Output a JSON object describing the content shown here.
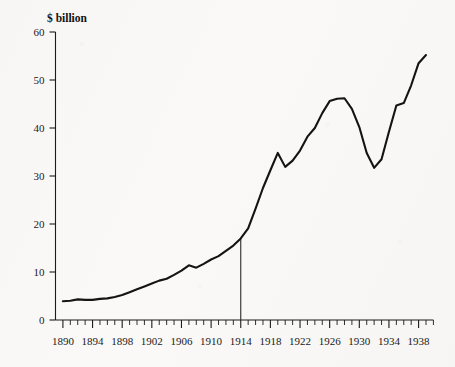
{
  "figure": {
    "background_color": "#faf9f7",
    "line_color": "#141414",
    "axis_color": "#1b1b1b"
  },
  "axis_title": "$ billion",
  "chart_data": {
    "type": "line",
    "title": "",
    "subtitle": "",
    "xlabel": "",
    "ylabel": "$ billion",
    "xlim": [
      1889,
      1940
    ],
    "ylim": [
      0,
      60
    ],
    "grid": false,
    "legend": "none",
    "y_ticks": [
      0,
      10,
      20,
      30,
      40,
      50,
      60
    ],
    "y_tick_labels": [
      "0",
      "10",
      "20",
      "30",
      "40",
      "50",
      "60"
    ],
    "x_ticks": [
      1890,
      1894,
      1898,
      1902,
      1906,
      1910,
      1914,
      1918,
      1922,
      1926,
      1930,
      1934,
      1938
    ],
    "x_tick_labels": [
      "1890",
      "1894",
      "1898",
      "1902",
      "1906",
      "1910",
      "1914",
      "1918",
      "1922",
      "1926",
      "1930",
      "1934",
      "1938"
    ],
    "x_minor_tick_step": 1,
    "annotations": [
      {
        "type": "vertical-line",
        "x": 1914,
        "y_from": 0,
        "y_to": 17,
        "label": ""
      }
    ],
    "x": [
      1890,
      1891,
      1892,
      1893,
      1894,
      1895,
      1896,
      1897,
      1898,
      1899,
      1900,
      1901,
      1902,
      1903,
      1904,
      1905,
      1906,
      1907,
      1908,
      1909,
      1910,
      1911,
      1912,
      1913,
      1914,
      1915,
      1916,
      1917,
      1918,
      1919,
      1920,
      1921,
      1922,
      1923,
      1924,
      1925,
      1926,
      1927,
      1928,
      1929,
      1930,
      1931,
      1932,
      1933,
      1934,
      1935,
      1936,
      1937,
      1938,
      1939
    ],
    "series": [
      {
        "name": "$ billion",
        "values": [
          3.9,
          4.0,
          4.3,
          4.2,
          4.2,
          4.4,
          4.5,
          4.8,
          5.2,
          5.8,
          6.4,
          7.0,
          7.6,
          8.2,
          8.6,
          9.4,
          10.3,
          11.4,
          10.9,
          11.7,
          12.6,
          13.3,
          14.4,
          15.5,
          17.0,
          19.1,
          23.2,
          27.5,
          31.2,
          34.8,
          31.9,
          33.2,
          35.3,
          38.2,
          40.0,
          43.1,
          45.6,
          46.1,
          46.2,
          44.0,
          40.2,
          34.8,
          31.7,
          33.5,
          39.2,
          44.7,
          45.2,
          48.9,
          53.5,
          55.2
        ]
      }
    ]
  }
}
